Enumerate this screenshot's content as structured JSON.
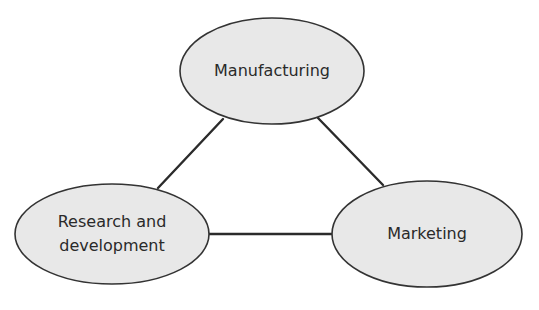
{
  "diagram": {
    "type": "triangle-relationship",
    "colors": {
      "node_fill": "#e8e8e8",
      "node_stroke": "#333333",
      "connector": "#2b2b2b",
      "text": "#2a2a2a",
      "background": "#ffffff"
    },
    "nodes": [
      {
        "id": "manufacturing",
        "label": "Manufacturing",
        "shape": "ellipse"
      },
      {
        "id": "research",
        "label": "Research and\ndevelopment",
        "shape": "ellipse"
      },
      {
        "id": "marketing",
        "label": "Marketing",
        "shape": "ellipse"
      }
    ],
    "edges": [
      {
        "from": "research",
        "to": "manufacturing"
      },
      {
        "from": "manufacturing",
        "to": "marketing"
      },
      {
        "from": "research",
        "to": "marketing"
      }
    ]
  }
}
